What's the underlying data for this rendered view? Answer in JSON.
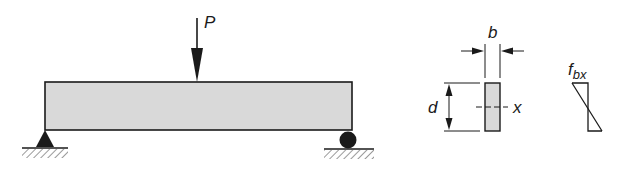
{
  "diagram": {
    "load": {
      "label": "P"
    },
    "cross_section": {
      "width_label": "b",
      "depth_label": "d",
      "axis_label": "x"
    },
    "stress": {
      "label_main": "f",
      "label_sub": "bx"
    },
    "colors": {
      "line": "#1a1a1a",
      "beam_fill": "#d9d9d9",
      "background": "#ffffff"
    }
  }
}
